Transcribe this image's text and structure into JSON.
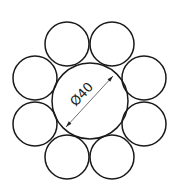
{
  "diagram": {
    "title": "",
    "type": "cross-section",
    "center_circle": {
      "cx": 90,
      "cy": 101,
      "r": 38
    },
    "outer_circles": [
      {
        "cx": 67,
        "cy": 44,
        "r": 22
      },
      {
        "cx": 112,
        "cy": 44,
        "r": 22
      },
      {
        "cx": 35,
        "cy": 78,
        "r": 22
      },
      {
        "cx": 144,
        "cy": 78,
        "r": 22
      },
      {
        "cx": 35,
        "cy": 124,
        "r": 22
      },
      {
        "cx": 144,
        "cy": 124,
        "r": 22
      },
      {
        "cx": 67,
        "cy": 157,
        "r": 22
      },
      {
        "cx": 112,
        "cy": 157,
        "r": 22
      }
    ],
    "dimension": {
      "label": "Ø40",
      "x1": 66,
      "y1": 127,
      "x2": 113,
      "y2": 76,
      "angle_deg": -47
    },
    "stroke_color": "#1a1a1a",
    "background": "#ffffff"
  }
}
